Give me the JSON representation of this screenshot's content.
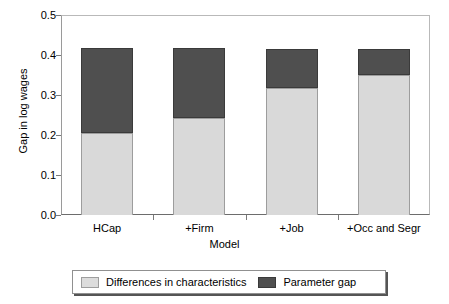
{
  "chart_data": {
    "type": "bar",
    "subtype": "stacked-bar",
    "title": "",
    "xlabel": "Model",
    "ylabel": "Gap in log wages",
    "categories": [
      "HCap",
      "+Firm",
      "+Job",
      "+Occ and Segr"
    ],
    "series": [
      {
        "name": "Differences in characteristics",
        "color": "#d9d9d9",
        "values": [
          0.205,
          0.243,
          0.317,
          0.35
        ]
      },
      {
        "name": "Parameter gap",
        "color": "#4f4f4f",
        "values": [
          0.212,
          0.174,
          0.098,
          0.065
        ]
      }
    ],
    "totals": [
      0.417,
      0.417,
      0.415,
      0.415
    ],
    "ylim": [
      0.0,
      0.5
    ],
    "ytick_labels": [
      "0.5",
      "0.4",
      "0.3",
      "0.2",
      "0.1",
      "0.0"
    ],
    "ytick_values": [
      0.5,
      0.4,
      0.3,
      0.2,
      0.1,
      0.0
    ],
    "grid": false,
    "legend_position": "bottom"
  },
  "axes": {
    "y_title": "Gap in log wages",
    "x_title": "Model"
  },
  "legend": {
    "entries": [
      {
        "label": "Differences in characteristics",
        "swatch": "light"
      },
      {
        "label": "Parameter gap",
        "swatch": "dark"
      }
    ]
  }
}
